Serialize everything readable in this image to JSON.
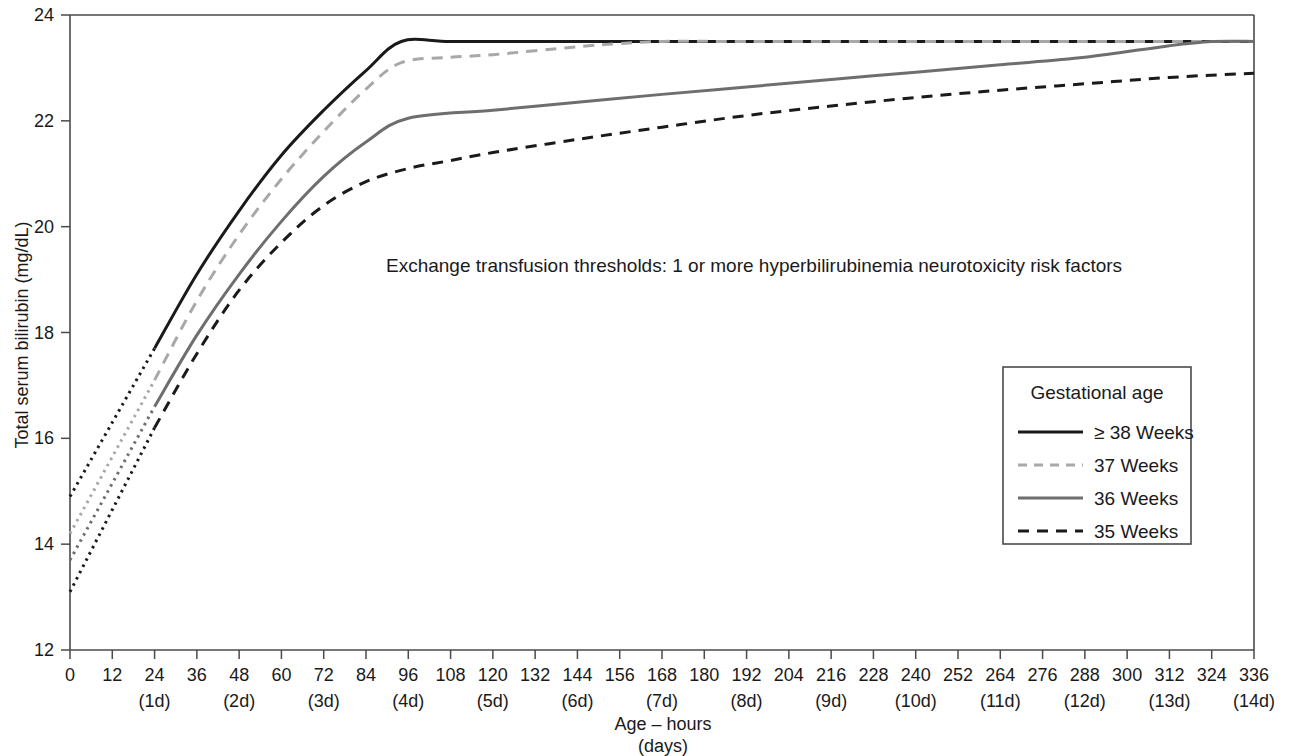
{
  "chart_data": {
    "type": "line",
    "title": "",
    "annotation": "Exchange transfusion thresholds: 1 or more hyperbilirubinemia neurotoxicity risk factors",
    "xlabel_line1": "Age – hours",
    "xlabel_line2": "(days)",
    "ylabel": "Total serum bilirubin (mg/dL)",
    "xlim": [
      0,
      336
    ],
    "ylim": [
      12,
      24
    ],
    "grid": false,
    "legend_position": "right-middle",
    "legend_title": "Gestational age",
    "x_ticks": [
      0,
      12,
      24,
      36,
      48,
      60,
      72,
      84,
      96,
      108,
      120,
      132,
      144,
      156,
      168,
      180,
      192,
      204,
      216,
      228,
      240,
      252,
      264,
      276,
      288,
      300,
      312,
      324,
      336
    ],
    "x_tick_labels": [
      "0",
      "12",
      "24",
      "36",
      "48",
      "60",
      "72",
      "84",
      "96",
      "108",
      "120",
      "132",
      "144",
      "156",
      "168",
      "180",
      "192",
      "204",
      "216",
      "228",
      "240",
      "252",
      "264",
      "276",
      "288",
      "300",
      "312",
      "324",
      "336"
    ],
    "x_day_ticks": [
      24,
      48,
      72,
      96,
      120,
      144,
      168,
      192,
      216,
      240,
      264,
      288,
      312,
      336
    ],
    "x_day_labels": [
      "(1d)",
      "(2d)",
      "(3d)",
      "(4d)",
      "(5d)",
      "(6d)",
      "(7d)",
      "(8d)",
      "(9d)",
      "(10d)",
      "(11d)",
      "(12d)",
      "(13d)",
      "(14d)"
    ],
    "y_ticks": [
      12,
      14,
      16,
      18,
      20,
      22,
      24
    ],
    "y_tick_labels": [
      "12",
      "14",
      "16",
      "18",
      "20",
      "22",
      "24"
    ],
    "series": [
      {
        "name": "≥ 38 Weeks",
        "legend_label": "≥ 38 Weeks",
        "color": "#1a1a1a",
        "style": "solid",
        "width": 3.0,
        "extrapolated_segment": {
          "x": [
            0,
            24
          ],
          "y": [
            14.9,
            17.7
          ],
          "style": "dotted"
        },
        "x": [
          24,
          36,
          48,
          60,
          72,
          84,
          94,
          108,
          132,
          156,
          192,
          240,
          288,
          336
        ],
        "y": [
          17.7,
          19.1,
          20.3,
          21.35,
          22.2,
          22.95,
          23.5,
          23.5,
          23.5,
          23.5,
          23.5,
          23.5,
          23.5,
          23.5
        ]
      },
      {
        "name": "37 Weeks",
        "legend_label": "37 Weeks",
        "color": "#a8a8a8",
        "style": "dashed",
        "width": 3.0,
        "extrapolated_segment": {
          "x": [
            0,
            24
          ],
          "y": [
            14.2,
            17.1
          ],
          "style": "dotted"
        },
        "x": [
          24,
          36,
          48,
          60,
          72,
          84,
          94,
          108,
          120,
          144,
          156,
          168,
          192,
          240,
          288,
          336
        ],
        "y": [
          17.1,
          18.6,
          19.85,
          20.9,
          21.8,
          22.6,
          23.1,
          23.2,
          23.25,
          23.4,
          23.46,
          23.5,
          23.5,
          23.5,
          23.5,
          23.5
        ]
      },
      {
        "name": "36 Weeks",
        "legend_label": "36 Weeks",
        "color": "#6e6e6e",
        "style": "solid",
        "width": 3.0,
        "extrapolated_segment": {
          "x": [
            0,
            24
          ],
          "y": [
            13.7,
            16.6
          ],
          "style": "dotted"
        },
        "x": [
          24,
          36,
          48,
          60,
          72,
          84,
          96,
          120,
          144,
          168,
          192,
          216,
          240,
          264,
          288,
          312,
          324,
          336
        ],
        "y": [
          16.6,
          17.95,
          19.1,
          20.1,
          20.95,
          21.6,
          22.05,
          22.2,
          22.35,
          22.5,
          22.64,
          22.78,
          22.92,
          23.06,
          23.2,
          23.42,
          23.5,
          23.5
        ]
      },
      {
        "name": "35 Weeks",
        "legend_label": "35 Weeks",
        "color": "#1a1a1a",
        "style": "dashed",
        "width": 3.0,
        "extrapolated_segment": {
          "x": [
            0,
            24
          ],
          "y": [
            13.1,
            16.2
          ],
          "style": "dotted"
        },
        "x": [
          24,
          36,
          48,
          60,
          72,
          84,
          96,
          108,
          120,
          144,
          168,
          192,
          216,
          240,
          264,
          288,
          312,
          336
        ],
        "y": [
          16.2,
          17.6,
          18.8,
          19.7,
          20.4,
          20.85,
          21.1,
          21.25,
          21.4,
          21.65,
          21.88,
          22.1,
          22.28,
          22.44,
          22.58,
          22.7,
          22.82,
          22.9
        ]
      }
    ]
  },
  "legend": {
    "title": "Gestational age",
    "entries": [
      {
        "label": "≥ 38 Weeks"
      },
      {
        "label": "37 Weeks"
      },
      {
        "label": "36 Weeks"
      },
      {
        "label": "35 Weeks"
      }
    ]
  },
  "axes": {
    "y_title": "Total serum bilirubin (mg/dL)",
    "x_title_hours": "Age – hours",
    "x_title_days": "(days)"
  },
  "annotation": {
    "text": "Exchange transfusion thresholds: 1 or more hyperbilirubinemia neurotoxicity risk factors"
  },
  "colors": {
    "axis": "#4a4a4a",
    "text": "#1a1a1a",
    "series_38w": "#1a1a1a",
    "series_37w": "#a8a8a8",
    "series_36w": "#6e6e6e",
    "series_35w": "#1a1a1a",
    "background": "#ffffff"
  }
}
